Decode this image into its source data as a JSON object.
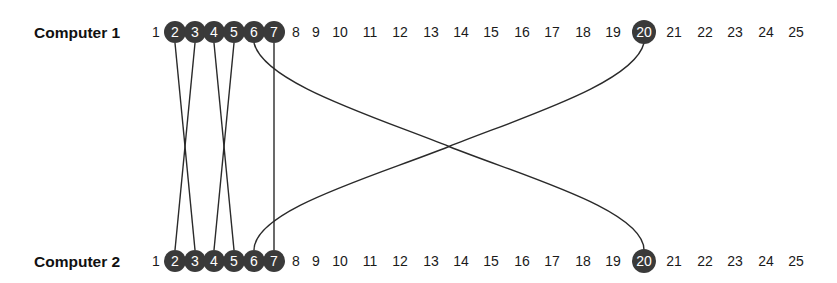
{
  "diagram": {
    "rows": [
      {
        "label": "Computer 1",
        "id": "computer-1"
      },
      {
        "label": "Computer 2",
        "id": "computer-2"
      }
    ],
    "numbers": [
      "1",
      "2",
      "3",
      "4",
      "5",
      "6",
      "7",
      "8",
      "9",
      "10",
      "11",
      "12",
      "13",
      "14",
      "15",
      "16",
      "17",
      "18",
      "19",
      "20",
      "21",
      "22",
      "23",
      "24",
      "25"
    ],
    "highlighted": [
      "2",
      "3",
      "4",
      "5",
      "6",
      "7",
      "20"
    ],
    "connections": [
      {
        "from": "2",
        "to": "3"
      },
      {
        "from": "3",
        "to": "2"
      },
      {
        "from": "4",
        "to": "5"
      },
      {
        "from": "5",
        "to": "4"
      },
      {
        "from": "6",
        "to": "20"
      },
      {
        "from": "7",
        "to": "7"
      },
      {
        "from": "20",
        "to": "6"
      }
    ],
    "colors": {
      "node_fill": "#3a3a3a",
      "node_text": "#ffffff",
      "line": "#2a2a2a",
      "text": "#1a1a1a"
    }
  }
}
